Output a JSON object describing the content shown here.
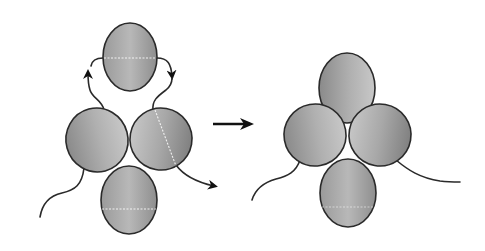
{
  "diagram": {
    "title": "",
    "colors": {
      "subunit_light": "#c4c4c4",
      "subunit_dark": "#7c7c7c",
      "outline": "#2a2a2a",
      "background": "#ffffff"
    },
    "left_state": {
      "label": "",
      "subunits": [
        {
          "id": "top",
          "cx": 130,
          "cy": 57,
          "rx": 27,
          "ry": 34,
          "rotate": 0
        },
        {
          "id": "left",
          "cx": 97,
          "cy": 140,
          "rx": 31,
          "ry": 32,
          "rotate": -15
        },
        {
          "id": "right",
          "cx": 161,
          "cy": 139,
          "rx": 31,
          "ry": 31,
          "rotate": 10
        },
        {
          "id": "bottom",
          "cx": 129,
          "cy": 200,
          "rx": 28,
          "ry": 34,
          "rotate": 0
        }
      ],
      "arrows": [
        "left-subunit-to-top",
        "top-to-right-subunit",
        "right-subunit-outward"
      ]
    },
    "transition_arrow": {
      "from_x": 213,
      "to_x": 257,
      "y": 124
    },
    "right_state": {
      "label": "",
      "subunits": [
        {
          "id": "top",
          "cx": 347,
          "cy": 88,
          "rx": 28,
          "ry": 35,
          "rotate": 0
        },
        {
          "id": "left",
          "cx": 315,
          "cy": 135,
          "rx": 31,
          "ry": 31,
          "rotate": -10
        },
        {
          "id": "right",
          "cx": 380,
          "cy": 135,
          "rx": 31,
          "ry": 31,
          "rotate": 10
        },
        {
          "id": "bottom",
          "cx": 348,
          "cy": 193,
          "rx": 28,
          "ry": 34,
          "rotate": 0
        }
      ]
    }
  }
}
